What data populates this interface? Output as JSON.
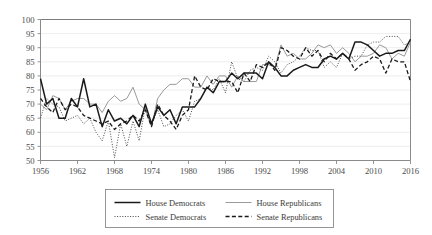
{
  "chart_data": {
    "type": "line",
    "title": "",
    "subtitle": "",
    "xlabel": "",
    "ylabel": "",
    "xlim": [
      1956,
      2016
    ],
    "ylim": [
      50,
      100
    ],
    "grid": true,
    "legend_position": "bottom",
    "x_ticks": [
      1956,
      1962,
      1968,
      1974,
      1980,
      1986,
      1992,
      1998,
      2004,
      2010,
      2016
    ],
    "y_ticks": [
      50,
      55,
      60,
      65,
      70,
      75,
      80,
      85,
      90,
      95,
      100
    ],
    "x": [
      1956,
      1957,
      1958,
      1959,
      1960,
      1961,
      1962,
      1963,
      1964,
      1965,
      1966,
      1967,
      1968,
      1969,
      1970,
      1971,
      1972,
      1973,
      1974,
      1975,
      1976,
      1977,
      1978,
      1979,
      1980,
      1981,
      1982,
      1983,
      1984,
      1985,
      1986,
      1987,
      1988,
      1989,
      1990,
      1991,
      1992,
      1993,
      1994,
      1995,
      1996,
      1997,
      1998,
      1999,
      2000,
      2001,
      2002,
      2003,
      2004,
      2005,
      2006,
      2007,
      2008,
      2009,
      2010,
      2011,
      2012,
      2013,
      2014,
      2015,
      2016
    ],
    "series": [
      {
        "name": "House Democrats",
        "style": "solid-thick-black",
        "color": "#1a1a1a",
        "values": [
          79,
          70,
          72,
          65,
          65,
          72,
          69,
          79,
          69,
          70,
          62,
          68,
          64,
          65,
          63,
          66,
          62,
          70,
          63,
          69,
          66,
          68,
          63,
          69,
          69,
          69,
          72,
          76,
          74,
          78,
          78,
          81,
          79,
          81,
          81,
          81,
          79,
          85,
          83,
          80,
          80,
          82,
          83,
          84,
          83,
          83,
          86,
          87,
          86,
          88,
          86,
          92,
          92,
          91,
          89,
          87,
          88,
          88,
          89,
          89,
          93
        ]
      },
      {
        "name": "House Republicans",
        "style": "solid-thin-gray",
        "color": "#9a9a9a",
        "values": [
          70,
          68,
          73,
          72,
          68,
          71,
          72,
          72,
          70,
          70,
          67,
          71,
          73,
          71,
          72,
          76,
          70,
          68,
          62,
          72,
          75,
          77,
          77,
          79,
          79,
          76,
          76,
          80,
          77,
          80,
          80,
          76,
          80,
          78,
          78,
          78,
          84,
          84,
          83,
          91,
          87,
          88,
          86,
          86,
          88,
          91,
          90,
          91,
          88,
          90,
          88,
          85,
          87,
          87,
          88,
          91,
          90,
          86,
          88,
          87,
          92
        ]
      },
      {
        "name": "Senate Democrats",
        "style": "dotted",
        "color": "#4a4a4a",
        "values": [
          65,
          72,
          70,
          69,
          64,
          65,
          66,
          63,
          65,
          60,
          57,
          64,
          51,
          63,
          55,
          64,
          57,
          69,
          63,
          68,
          62,
          63,
          66,
          68,
          64,
          71,
          72,
          76,
          75,
          79,
          74,
          85,
          79,
          78,
          82,
          83,
          82,
          87,
          85,
          81,
          84,
          85,
          87,
          90,
          89,
          89,
          83,
          85,
          83,
          88,
          86,
          87,
          87,
          91,
          92,
          92,
          94,
          94,
          94,
          91,
          92
        ]
      },
      {
        "name": "Senate Republicans",
        "style": "dashed",
        "color": "#1a1a1a",
        "values": [
          72,
          69,
          67,
          72,
          68,
          70,
          69,
          66,
          65,
          64,
          63,
          64,
          61,
          63,
          64,
          66,
          64,
          68,
          62,
          70,
          66,
          64,
          61,
          66,
          68,
          80,
          76,
          75,
          79,
          78,
          78,
          78,
          74,
          81,
          78,
          84,
          83,
          85,
          82,
          90,
          89,
          87,
          86,
          90,
          87,
          89,
          85,
          88,
          86,
          88,
          86,
          82,
          84,
          85,
          87,
          86,
          81,
          86,
          85,
          85,
          78
        ]
      }
    ]
  },
  "legend": {
    "items": [
      {
        "label": "House Democrats",
        "key": "house-democrats"
      },
      {
        "label": "House Republicans",
        "key": "house-republicans"
      },
      {
        "label": "Senate Democrats",
        "key": "senate-democrats"
      },
      {
        "label": "Senate Republicans",
        "key": "senate-republicans"
      }
    ]
  }
}
